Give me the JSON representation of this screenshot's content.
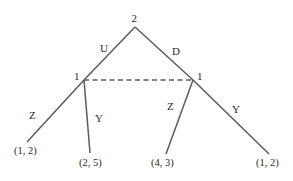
{
  "diagram": {
    "type": "extensive-form game tree",
    "root": {
      "player": "2",
      "actions": [
        "U",
        "D"
      ]
    },
    "nodes": [
      {
        "id": "left",
        "player": "1",
        "reached_by": "U",
        "actions": [
          {
            "label": "Z",
            "payoff": "(1, 2)"
          },
          {
            "label": "Y",
            "payoff": "(2, 5)"
          }
        ]
      },
      {
        "id": "right",
        "player": "1",
        "reached_by": "D",
        "actions": [
          {
            "label": "Z",
            "payoff": "(4, 3)"
          },
          {
            "label": "Y",
            "payoff": "(1, 2)"
          }
        ]
      }
    ],
    "information_set": "dashed line connecting both player 1 nodes",
    "colors": {
      "line": "#5a5a5a",
      "text": "#2a2a2a",
      "background": "#ffffff"
    }
  },
  "labels": {
    "root_player": "2",
    "edge_u": "U",
    "edge_d": "D",
    "left_player": "1",
    "right_player": "1",
    "left_z": "Z",
    "left_y": "Y",
    "right_z": "Z",
    "right_y": "Y",
    "payoff_1": "(1, 2)",
    "payoff_2": "(2, 5)",
    "payoff_3": "(4, 3)",
    "payoff_4": "(1, 2)"
  }
}
